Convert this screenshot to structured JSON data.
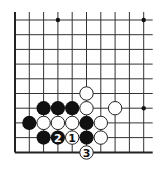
{
  "diagram": {
    "type": "go-board-fragment",
    "grid": {
      "columns_x": [
        15,
        29.3,
        43.6,
        57.9,
        72.2,
        86.5,
        100.8,
        115.1,
        129.4,
        143.7
      ],
      "rows_y": [
        20,
        34.7,
        49.4,
        64.1,
        78.8,
        93.5,
        108.2,
        122.9,
        137.6,
        152.5
      ],
      "left_edge": true,
      "bottom_edge": true,
      "line_color": "#333333",
      "edge_color": "#222222"
    },
    "star_points": [
      {
        "col": 3,
        "row": 0
      },
      {
        "col": 9,
        "row": 0
      },
      {
        "col": 9,
        "row": 6
      }
    ],
    "stones": [
      {
        "color": "white",
        "col": 5,
        "row": 5,
        "label": ""
      },
      {
        "color": "black",
        "col": 2,
        "row": 6,
        "label": ""
      },
      {
        "color": "black",
        "col": 3,
        "row": 6,
        "label": ""
      },
      {
        "color": "black",
        "col": 4,
        "row": 6,
        "label": ""
      },
      {
        "color": "white",
        "col": 5,
        "row": 6,
        "label": ""
      },
      {
        "color": "white",
        "col": 7,
        "row": 6,
        "label": ""
      },
      {
        "color": "black",
        "col": 1,
        "row": 7,
        "label": ""
      },
      {
        "color": "white",
        "col": 2,
        "row": 7,
        "label": ""
      },
      {
        "color": "white",
        "col": 3,
        "row": 7,
        "label": ""
      },
      {
        "color": "white",
        "col": 4,
        "row": 7,
        "label": ""
      },
      {
        "color": "black",
        "col": 5,
        "row": 7,
        "label": ""
      },
      {
        "color": "white",
        "col": 6,
        "row": 7,
        "label": ""
      },
      {
        "color": "black",
        "col": 2,
        "row": 8,
        "label": ""
      },
      {
        "color": "black",
        "col": 3,
        "row": 8,
        "label": "2"
      },
      {
        "color": "white",
        "col": 4,
        "row": 8,
        "label": "1"
      },
      {
        "color": "black",
        "col": 5,
        "row": 8,
        "label": ""
      },
      {
        "color": "white",
        "col": 6,
        "row": 8,
        "label": ""
      },
      {
        "color": "white",
        "col": 5,
        "row": 9,
        "label": "3"
      }
    ],
    "colors": {
      "black_stone": "#111111",
      "white_stone_fill": "#ffffff",
      "white_stone_stroke": "#222222",
      "background": "#ffffff"
    }
  }
}
